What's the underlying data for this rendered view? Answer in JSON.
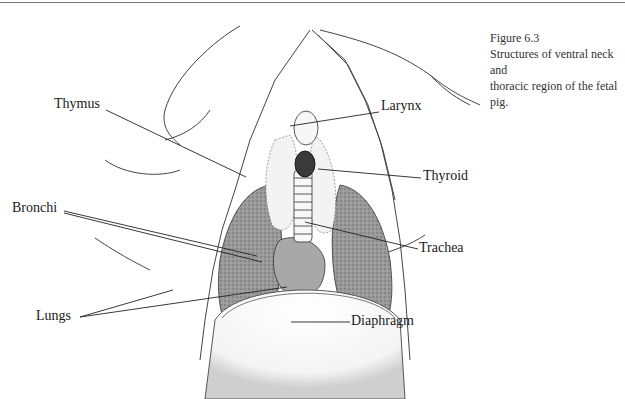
{
  "figure": {
    "number": "Figure 6.3",
    "caption_line1": "Structures of ventral neck and",
    "caption_line2": "thoracic region of the fetal pig."
  },
  "labels": {
    "thymus": "Thymus",
    "larynx": "Larynx",
    "thyroid": "Thyroid",
    "bronchi": "Bronchi",
    "trachea": "Trachea",
    "lungs": "Lungs",
    "diaphragm": "Diaphragm"
  },
  "colors": {
    "ink": "#222222",
    "lung_fill": "#8f8f8f",
    "background": "#ffffff"
  }
}
